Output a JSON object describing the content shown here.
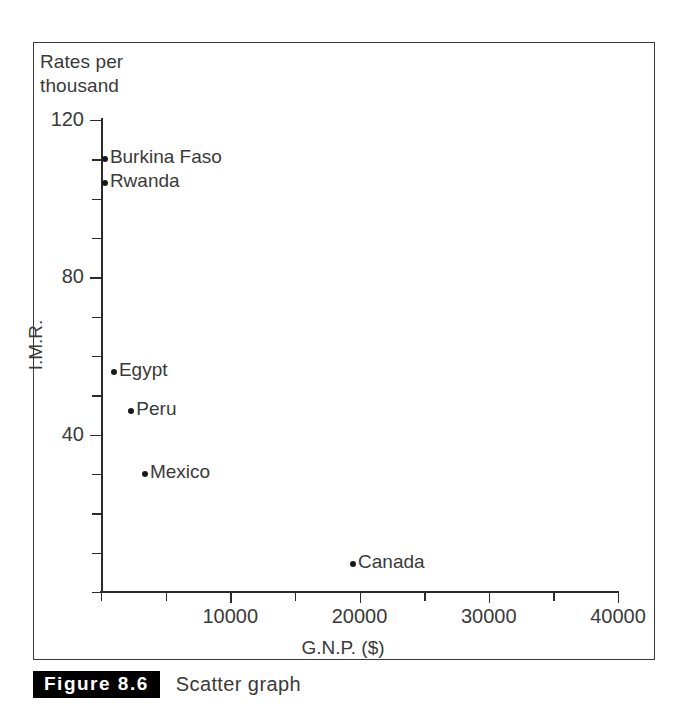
{
  "figure": {
    "caption_badge": "Figure 8.6",
    "caption_text": "Scatter graph",
    "header_note": "Rates per\nthousand"
  },
  "chart_data": {
    "type": "scatter",
    "title": "Scatter graph",
    "xlabel": "G.N.P. ($)",
    "ylabel": "I.M.R.",
    "ylabel_note": "Rates per thousand",
    "xlim": [
      0,
      40000
    ],
    "ylim": [
      0,
      120
    ],
    "xticks": [
      0,
      5000,
      10000,
      15000,
      20000,
      25000,
      30000,
      35000,
      40000
    ],
    "xtick_labels": [
      "",
      "",
      "10000",
      "",
      "20000",
      "",
      "30000",
      "",
      "40000"
    ],
    "yticks": [
      0,
      10,
      20,
      30,
      40,
      50,
      60,
      70,
      80,
      90,
      100,
      110,
      120
    ],
    "ytick_labels": [
      "",
      "",
      "",
      "",
      "40",
      "",
      "",
      "",
      "80",
      "",
      "",
      "",
      "120"
    ],
    "grid": false,
    "legend": false,
    "points": [
      {
        "label": "Burkina Faso",
        "x": 300,
        "y": 110
      },
      {
        "label": "Rwanda",
        "x": 300,
        "y": 104
      },
      {
        "label": "Egypt",
        "x": 1000,
        "y": 56
      },
      {
        "label": "Peru",
        "x": 2350,
        "y": 46
      },
      {
        "label": "Mexico",
        "x": 3400,
        "y": 30
      },
      {
        "label": "Canada",
        "x": 19500,
        "y": 7
      }
    ]
  },
  "colors": {
    "point": "#1a1a1a",
    "axis": "#2b2b2b",
    "text": "#3a3a3a",
    "frame": "#3b3b3b",
    "badge_bg": "#000000",
    "badge_fg": "#ffffff"
  }
}
